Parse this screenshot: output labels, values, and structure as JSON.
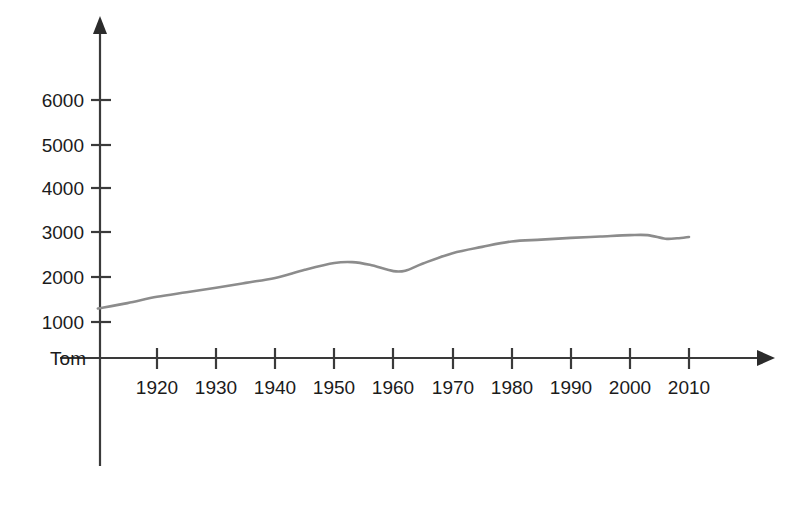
{
  "chart_data": {
    "type": "line",
    "title": "",
    "subtitle": "",
    "xlabel": "",
    "ylabel": "",
    "origin_label": "Tom",
    "grid": false,
    "legend": "none",
    "line_color": "#8c8c8c",
    "axis_color": "#3a3a3a",
    "text_color": "#1b1b1b",
    "xlim": [
      1910,
      2018
    ],
    "ylim": [
      0,
      6500
    ],
    "x_tick_labels": [
      "1920",
      "1930",
      "1940",
      "1950",
      "1960",
      "1970",
      "1980",
      "1990",
      "2000",
      "2010"
    ],
    "x_ticks": [
      1920,
      1930,
      1940,
      1950,
      1960,
      1970,
      1980,
      1990,
      2000,
      2010
    ],
    "y_tick_labels": [
      "1000",
      "2000",
      "3000",
      "4000",
      "5000",
      "6000"
    ],
    "y_ticks": [
      1000,
      2000,
      3000,
      4000,
      5000,
      6000
    ],
    "series": [
      {
        "name": "series-1",
        "x": [
          1910,
          1915,
          1920,
          1925,
          1930,
          1935,
          1940,
          1945,
          1950,
          1953,
          1956,
          1960,
          1962,
          1965,
          1970,
          1975,
          1980,
          1985,
          1990,
          1995,
          2000,
          2003,
          2006,
          2008,
          2010
        ],
        "values": [
          1300,
          1420,
          1560,
          1660,
          1760,
          1870,
          1980,
          2160,
          2310,
          2330,
          2270,
          2130,
          2140,
          2300,
          2530,
          2670,
          2790,
          2830,
          2870,
          2900,
          2930,
          2930,
          2850,
          2860,
          2890
        ]
      }
    ]
  },
  "axes": {
    "y_axis_arrow": "arrow-up",
    "x_axis_arrow": "arrow-right"
  }
}
